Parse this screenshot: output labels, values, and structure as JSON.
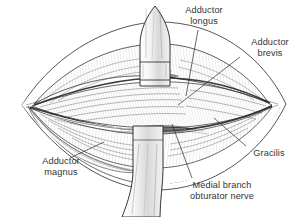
{
  "figure": {
    "type": "medical-illustration",
    "style": "pen-and-ink line drawing",
    "background_color": "#ffffff",
    "ink_color": "#1a1a1a",
    "label_color": "#333333"
  },
  "labels": {
    "adductor_longus": {
      "line1": "Adductor",
      "line2": "longus"
    },
    "adductor_brevis": {
      "line1": "Adductor",
      "line2": "brevis"
    },
    "adductor_magnus": {
      "line1": "Adductor",
      "line2": "magnus"
    },
    "gracilis": {
      "line1": "Gracilis"
    },
    "medial_branch_obturator_nerve": {
      "line1": "Medial branch",
      "line2": "obturator nerve"
    }
  },
  "structures": [
    {
      "name": "adductor-longus-muscle"
    },
    {
      "name": "adductor-brevis-muscle"
    },
    {
      "name": "adductor-magnus-muscle"
    },
    {
      "name": "gracilis-muscle"
    },
    {
      "name": "medial-branch-obturator-nerve"
    },
    {
      "name": "retractor-blade-superior"
    },
    {
      "name": "retractor-blade-inferior"
    },
    {
      "name": "subcutaneous-fat-margin"
    },
    {
      "name": "skin-incision-edge"
    }
  ]
}
